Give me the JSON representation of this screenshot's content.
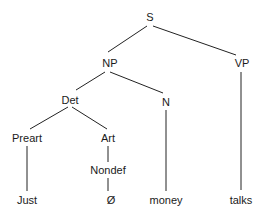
{
  "diagram": {
    "type": "syntax-tree",
    "nodes": {
      "S": {
        "label": "S",
        "x": 150,
        "y": 17
      },
      "NP": {
        "label": "NP",
        "x": 110,
        "y": 63
      },
      "VP": {
        "label": "VP",
        "x": 242,
        "y": 63
      },
      "Det": {
        "label": "Det",
        "x": 70,
        "y": 100
      },
      "N": {
        "label": "N",
        "x": 166,
        "y": 102
      },
      "Preart": {
        "label": "Preart",
        "x": 27,
        "y": 138
      },
      "Art": {
        "label": "Art",
        "x": 108,
        "y": 138
      },
      "Nondef": {
        "label": "Nondef",
        "x": 108,
        "y": 170
      },
      "Just": {
        "label": "Just",
        "x": 27,
        "y": 200
      },
      "Null": {
        "label": "Ø",
        "x": 111,
        "y": 200
      },
      "money": {
        "label": "money",
        "x": 166,
        "y": 200
      },
      "talks": {
        "label": "talks",
        "x": 241,
        "y": 200
      }
    },
    "edges": [
      [
        "S",
        "NP"
      ],
      [
        "S",
        "VP"
      ],
      [
        "NP",
        "Det"
      ],
      [
        "NP",
        "N"
      ],
      [
        "VP",
        "talks"
      ],
      [
        "Det",
        "Preart"
      ],
      [
        "Det",
        "Art"
      ],
      [
        "N",
        "money"
      ],
      [
        "Preart",
        "Just"
      ],
      [
        "Art",
        "Nondef"
      ],
      [
        "Nondef",
        "Null"
      ]
    ]
  }
}
